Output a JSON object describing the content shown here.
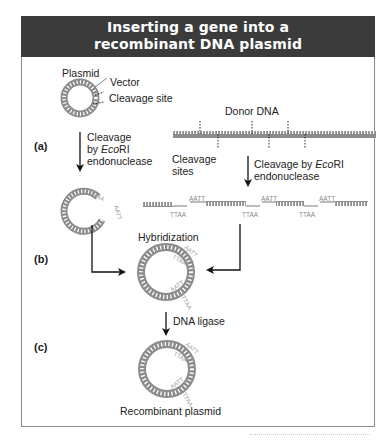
{
  "title": {
    "line1": "Inserting a gene into a",
    "line2": "recombinant DNA plasmid"
  },
  "labels": {
    "plasmid": "Plasmid",
    "vector": "Vector",
    "cleavage_site": "Cleavage site",
    "donor_dna": "Donor DNA",
    "cleavage_sites_1": "Cleavage",
    "cleavage_sites_2": "sites",
    "cleavage_left_1": "Cleavage",
    "cleavage_left_2_prefix": "by ",
    "cleavage_left_2_italic": "Eco",
    "cleavage_left_2_suffix": "RI",
    "cleavage_left_3": "endonuclease",
    "cleavage_right_1_prefix": "Cleavage by ",
    "cleavage_right_1_italic": "Eco",
    "cleavage_right_1_suffix": "RI",
    "cleavage_right_2": "endonuclease",
    "hybridization": "Hybridization",
    "dna_ligase": "DNA ligase",
    "recombinant_plasmid": "Recombinant plasmid"
  },
  "steps": {
    "a": "(a)",
    "b": "(b)",
    "c": "(c)"
  },
  "sticky_ends": {
    "top": "AATT",
    "bottom": "TTAA"
  },
  "colors": {
    "header_bg": "#3b3b3b",
    "dna": "#8c8c8c",
    "frame": "#8a8a8a",
    "arrow": "#111111"
  }
}
